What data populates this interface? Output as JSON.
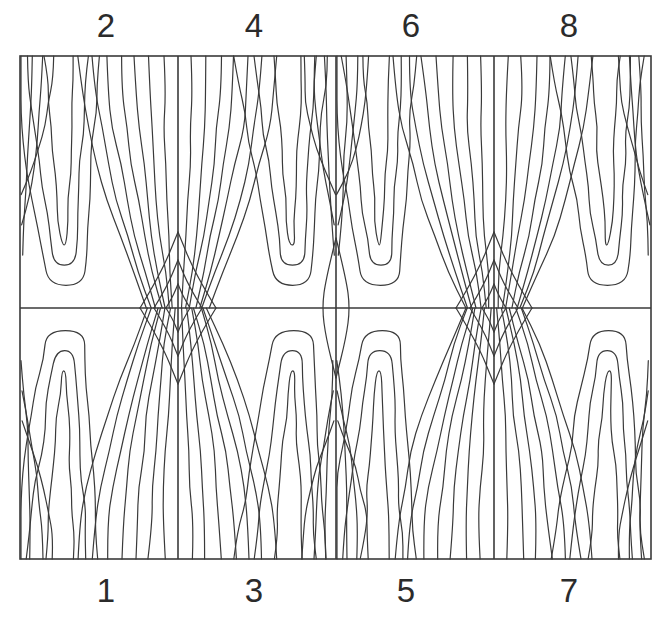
{
  "diagram": {
    "frame": {
      "x": 20,
      "y": 56,
      "width": 631,
      "height": 503
    },
    "midline_y": 308,
    "dividers_x": [
      178,
      336,
      494
    ],
    "line_color": "#3a3a3a",
    "frame_color": "#3a3a3a",
    "top_labels": [
      {
        "text": "2",
        "x": 106
      },
      {
        "text": "4",
        "x": 254
      },
      {
        "text": "6",
        "x": 411
      },
      {
        "text": "8",
        "x": 569
      }
    ],
    "bottom_labels": [
      {
        "text": "1",
        "x": 106
      },
      {
        "text": "3",
        "x": 254
      },
      {
        "text": "5",
        "x": 406
      },
      {
        "text": "7",
        "x": 569
      }
    ],
    "panels": [
      {
        "number": 1,
        "row": "bottom",
        "column": 1,
        "loop_center_x": 64,
        "mirrored": false
      },
      {
        "number": 2,
        "row": "top",
        "column": 1,
        "loop_center_x": 64,
        "mirrored": false
      },
      {
        "number": 3,
        "row": "bottom",
        "column": 2,
        "loop_center_x": 292,
        "mirrored": true
      },
      {
        "number": 4,
        "row": "top",
        "column": 2,
        "loop_center_x": 292,
        "mirrored": true
      },
      {
        "number": 5,
        "row": "bottom",
        "column": 3,
        "loop_center_x": 380,
        "mirrored": false
      },
      {
        "number": 6,
        "row": "top",
        "column": 3,
        "loop_center_x": 380,
        "mirrored": false
      },
      {
        "number": 7,
        "row": "bottom",
        "column": 4,
        "loop_center_x": 608,
        "mirrored": true
      },
      {
        "number": 8,
        "row": "top",
        "column": 4,
        "loop_center_x": 608,
        "mirrored": true
      }
    ]
  }
}
